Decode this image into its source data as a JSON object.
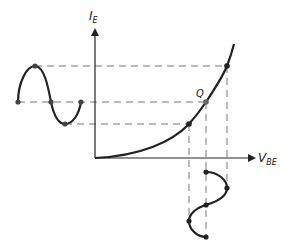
{
  "diagram": {
    "y_axis": {
      "label_main": "I",
      "label_sub": "E"
    },
    "x_axis": {
      "label_main": "V",
      "label_sub": "BE"
    },
    "q_point_label": "Q",
    "colors": {
      "stroke": "#222222",
      "dash": "#777777",
      "background": "#ffffff"
    },
    "curve_points": [
      [
        95,
        158
      ],
      [
        140,
        152
      ],
      [
        170,
        140
      ],
      [
        189,
        124
      ],
      [
        206,
        102
      ],
      [
        220,
        80
      ],
      [
        227,
        66
      ],
      [
        232,
        45
      ]
    ],
    "operating_points": [
      {
        "name": "low",
        "x": 189,
        "y": 124
      },
      {
        "name": "Q",
        "x": 206,
        "y": 102
      },
      {
        "name": "high",
        "x": 227,
        "y": 66
      }
    ],
    "input_waveform_left": {
      "points": [
        [
          18,
          102
        ],
        [
          35,
          66
        ],
        [
          51,
          102
        ],
        [
          65,
          124
        ],
        [
          81,
          102
        ]
      ]
    },
    "output_waveform_bottom": {
      "points": [
        [
          206,
          172
        ],
        [
          227,
          188
        ],
        [
          206,
          205
        ],
        [
          189,
          221
        ],
        [
          206,
          237
        ]
      ]
    }
  }
}
